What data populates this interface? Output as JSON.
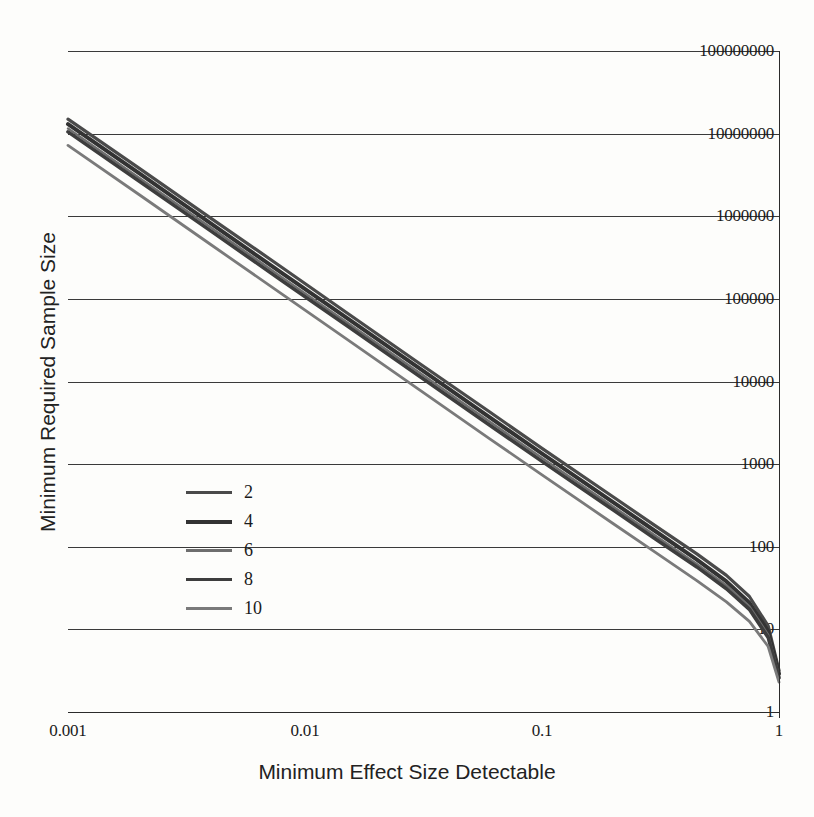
{
  "chart_data": {
    "type": "line",
    "title": "",
    "xlabel": "Minimum Effect Size Detectable",
    "ylabel": "Minimum Required Sample Size",
    "xscale": "log",
    "yscale": "log",
    "xlim": [
      0.001,
      1
    ],
    "ylim": [
      1,
      100000000
    ],
    "grid": "horizontal",
    "legend_position": "center-left",
    "legend_title": "",
    "xtick_labels": [
      "0.001",
      "0.01",
      "0.1",
      "1"
    ],
    "xticks": [
      0.001,
      0.01,
      0.1,
      1
    ],
    "ytick_labels": [
      "1",
      "10",
      "100",
      "1000",
      "10000",
      "100000",
      "1000000",
      "10000000",
      "100000000"
    ],
    "yticks": [
      1,
      10,
      100,
      1000,
      10000,
      100000,
      1000000,
      10000000,
      100000000
    ],
    "series": [
      {
        "name": "2",
        "color": "#4a4a4a",
        "width": 3.2,
        "x": [
          0.001,
          0.002,
          0.004,
          0.008,
          0.015,
          0.03,
          0.06,
          0.1,
          0.2,
          0.3,
          0.45,
          0.6,
          0.75,
          0.9,
          1.0
        ],
        "values": [
          15000000,
          3800000,
          950000,
          240000,
          68000,
          17000,
          4300,
          1550,
          400,
          180,
          82,
          45,
          25,
          11,
          3.2
        ]
      },
      {
        "name": "4",
        "color": "#333333",
        "width": 4.0,
        "x": [
          0.001,
          0.002,
          0.004,
          0.008,
          0.015,
          0.03,
          0.06,
          0.1,
          0.2,
          0.3,
          0.45,
          0.6,
          0.75,
          0.9,
          1.0
        ],
        "values": [
          13000000,
          3300000,
          820000,
          205000,
          59000,
          14800,
          3700,
          1340,
          345,
          155,
          70,
          38,
          21,
          9.5,
          2.9
        ]
      },
      {
        "name": "6",
        "color": "#6e6e6e",
        "width": 2.4,
        "x": [
          0.001,
          0.002,
          0.004,
          0.008,
          0.015,
          0.03,
          0.06,
          0.1,
          0.2,
          0.3,
          0.45,
          0.6,
          0.75,
          0.9,
          1.0
        ],
        "values": [
          11500000,
          2900000,
          730000,
          182000,
          52000,
          13100,
          3280,
          1185,
          305,
          137,
          62,
          34,
          19,
          8.6,
          2.7
        ]
      },
      {
        "name": "8",
        "color": "#3d3d3d",
        "width": 3.6,
        "x": [
          0.001,
          0.002,
          0.004,
          0.008,
          0.015,
          0.03,
          0.06,
          0.1,
          0.2,
          0.3,
          0.45,
          0.6,
          0.75,
          0.9,
          1.0
        ],
        "values": [
          10500000,
          2650000,
          665000,
          166000,
          47500,
          11900,
          2980,
          1080,
          278,
          125,
          57,
          31,
          17.5,
          8.0,
          2.6
        ]
      },
      {
        "name": "10",
        "color": "#7a7a7a",
        "width": 2.8,
        "x": [
          0.001,
          0.002,
          0.004,
          0.008,
          0.015,
          0.03,
          0.06,
          0.1,
          0.2,
          0.3,
          0.45,
          0.6,
          0.75,
          0.9,
          1.0
        ],
        "values": [
          7200000,
          1820000,
          455000,
          114000,
          32500,
          8150,
          2040,
          740,
          190,
          86,
          39,
          21.5,
          12.5,
          6.2,
          2.3
        ]
      }
    ]
  },
  "axes": {
    "y_labels": [
      "100000000",
      "10000000",
      "1000000",
      "100000",
      "10000",
      "1000",
      "100",
      "10",
      "1"
    ],
    "x_labels": [
      "0.001",
      "0.01",
      "0.1",
      "1"
    ],
    "x_title": "Minimum Effect Size Detectable",
    "y_title": "Minimum Required Sample Size"
  },
  "legend": {
    "items": [
      {
        "label": "2"
      },
      {
        "label": "4"
      },
      {
        "label": "6"
      },
      {
        "label": "8"
      },
      {
        "label": "10"
      }
    ]
  }
}
